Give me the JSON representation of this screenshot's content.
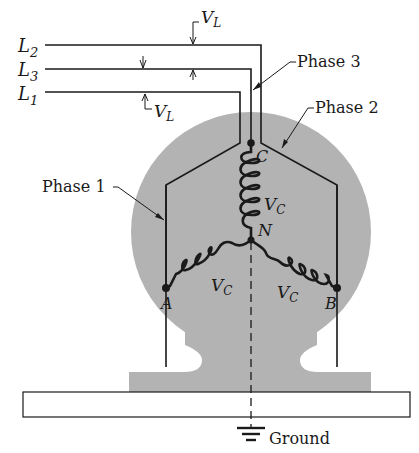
{
  "diagram": {
    "lines": [
      {
        "id": "L2",
        "label": "L",
        "sub": "2"
      },
      {
        "id": "L3",
        "label": "L",
        "sub": "3"
      },
      {
        "id": "L1",
        "label": "L",
        "sub": "1"
      }
    ],
    "voltage_labels": {
      "line_top": {
        "main": "V",
        "sub": "L"
      },
      "line_left": {
        "main": "V",
        "sub": "L"
      },
      "coil": {
        "main": "V",
        "sub": "C"
      }
    },
    "phases": {
      "phase1": "Phase 1",
      "phase2": "Phase 2",
      "phase3": "Phase 3"
    },
    "nodes": {
      "A": "A",
      "B": "B",
      "C": "C",
      "N": "N"
    },
    "ground_label": "Ground",
    "colors": {
      "housing": "#b3b3b3",
      "ink": "#1a1a1a",
      "background": "#ffffff"
    }
  }
}
